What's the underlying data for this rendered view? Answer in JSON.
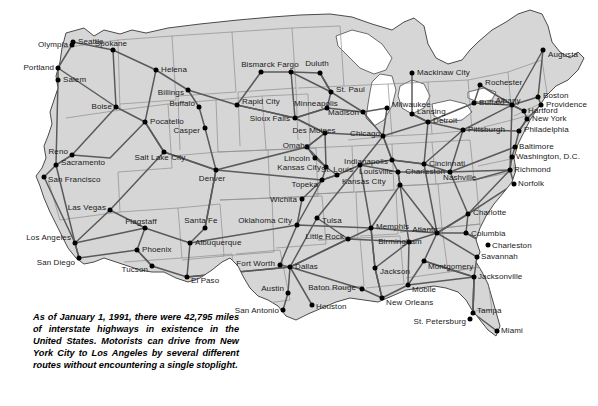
{
  "map": {
    "title": "Interstate Highway Map of the United States",
    "colors": {
      "background": "#ffffff",
      "land": "#d6d6d6",
      "state_border": "#8c8c8c",
      "coastline": "#4a4a4a",
      "highway": "#5a5a5a",
      "city_dot": "#000000",
      "label_text": "#1a1a1a"
    },
    "caption": "As of January 1, 1991, there were 42,795 miles of interstate highways in existence in the United States. Motorists can drive from New York City to Los Angeles by several different routes without encountering a single stoplight.",
    "cities": [
      {
        "name": "Olympia",
        "x": 72,
        "y": 45,
        "lx": 68,
        "ly": 45,
        "align": "l"
      },
      {
        "name": "Seattle",
        "x": 73,
        "y": 42,
        "lx": 78,
        "ly": 42,
        "align": "r"
      },
      {
        "name": "Spokane",
        "x": 113,
        "y": 50,
        "lx": 111,
        "ly": 44,
        "align": "c"
      },
      {
        "name": "Portland",
        "x": 58,
        "y": 68,
        "lx": 54,
        "ly": 68,
        "align": "l"
      },
      {
        "name": "Salem",
        "x": 58,
        "y": 80,
        "lx": 63,
        "ly": 80,
        "align": "r"
      },
      {
        "name": "Helena",
        "x": 156,
        "y": 70,
        "lx": 161,
        "ly": 70,
        "align": "r"
      },
      {
        "name": "Billings",
        "x": 188,
        "y": 90,
        "lx": 184,
        "ly": 93,
        "align": "l"
      },
      {
        "name": "Boise",
        "x": 116,
        "y": 107,
        "lx": 112,
        "ly": 107,
        "align": "l"
      },
      {
        "name": "Buffalo",
        "x": 199,
        "y": 107,
        "lx": 195,
        "ly": 104,
        "align": "l"
      },
      {
        "name": "Pocatello",
        "x": 145,
        "y": 122,
        "lx": 150,
        "ly": 122,
        "align": "r"
      },
      {
        "name": "Casper",
        "x": 205,
        "y": 128,
        "lx": 200,
        "ly": 131,
        "align": "l"
      },
      {
        "name": "Bismarck",
        "x": 261,
        "y": 72,
        "lx": 258,
        "ly": 65,
        "align": "c"
      },
      {
        "name": "Fargo",
        "x": 291,
        "y": 72,
        "lx": 288,
        "ly": 65,
        "align": "c"
      },
      {
        "name": "Duluth",
        "x": 320,
        "y": 73,
        "lx": 317,
        "ly": 64,
        "align": "c"
      },
      {
        "name": "Mackinaw City",
        "x": 412,
        "y": 73,
        "lx": 417,
        "ly": 73,
        "align": "r"
      },
      {
        "name": "Rochester",
        "x": 480,
        "y": 85,
        "lx": 485,
        "ly": 83,
        "align": "r"
      },
      {
        "name": "Augusta",
        "x": 543,
        "y": 50,
        "lx": 548,
        "ly": 55,
        "align": "r"
      },
      {
        "name": "St. Paul",
        "x": 331,
        "y": 92,
        "lx": 336,
        "ly": 90,
        "align": "r"
      },
      {
        "name": "Rapid City",
        "x": 237,
        "y": 105,
        "lx": 242,
        "ly": 102,
        "align": "r"
      },
      {
        "name": "Minneapolis",
        "x": 327,
        "y": 108,
        "lx": 316,
        "ly": 104,
        "align": "c"
      },
      {
        "name": "Madison",
        "x": 363,
        "y": 112,
        "lx": 359,
        "ly": 113,
        "align": "l"
      },
      {
        "name": "Milwaukee",
        "x": 387,
        "y": 108,
        "lx": 392,
        "ly": 105,
        "align": "r"
      },
      {
        "name": "Buffalo",
        "x": 474,
        "y": 103,
        "lx": 479,
        "ly": 103,
        "align": "r"
      },
      {
        "name": "Albany",
        "x": 512,
        "y": 105,
        "lx": 508,
        "ly": 101,
        "align": "c"
      },
      {
        "name": "Boston",
        "x": 538,
        "y": 97,
        "lx": 543,
        "ly": 96,
        "align": "r"
      },
      {
        "name": "Providence",
        "x": 541,
        "y": 105,
        "lx": 546,
        "ly": 105,
        "align": "r"
      },
      {
        "name": "Hartford",
        "x": 524,
        "y": 111,
        "lx": 528,
        "ly": 111,
        "align": "r"
      },
      {
        "name": "New York",
        "x": 527,
        "y": 119,
        "lx": 532,
        "ly": 119,
        "align": "r"
      },
      {
        "name": "Sioux Falls",
        "x": 295,
        "y": 118,
        "lx": 290,
        "ly": 119,
        "align": "l"
      },
      {
        "name": "Detroit",
        "x": 428,
        "y": 122,
        "lx": 433,
        "ly": 121,
        "align": "r"
      },
      {
        "name": "Lansing",
        "x": 412,
        "y": 114,
        "lx": 417,
        "ly": 112,
        "align": "r"
      },
      {
        "name": "Des Moines",
        "x": 325,
        "y": 133,
        "lx": 314,
        "ly": 131,
        "align": "c"
      },
      {
        "name": "Chicago",
        "x": 383,
        "y": 136,
        "lx": 350,
        "ly": 134,
        "align": "r"
      },
      {
        "name": "Pittsburgh",
        "x": 463,
        "y": 130,
        "lx": 468,
        "ly": 130,
        "align": "r"
      },
      {
        "name": "Philadelphia",
        "x": 519,
        "y": 131,
        "lx": 524,
        "ly": 130,
        "align": "r"
      },
      {
        "name": "Reno",
        "x": 72,
        "y": 155,
        "lx": 68,
        "ly": 152,
        "align": "l"
      },
      {
        "name": "Salt Lake City",
        "x": 164,
        "y": 152,
        "lx": 160,
        "ly": 158,
        "align": "c"
      },
      {
        "name": "Omaha",
        "x": 307,
        "y": 147,
        "lx": 296,
        "ly": 146,
        "align": "c"
      },
      {
        "name": "Indianapolis",
        "x": 392,
        "y": 160,
        "lx": 388,
        "ly": 162,
        "align": "l"
      },
      {
        "name": "Cincinnati",
        "x": 424,
        "y": 164,
        "lx": 429,
        "ly": 164,
        "align": "r"
      },
      {
        "name": "Baltimore",
        "x": 515,
        "y": 147,
        "lx": 519,
        "ly": 147,
        "align": "r"
      },
      {
        "name": "Washington, D.C.",
        "x": 512,
        "y": 157,
        "lx": 516,
        "ly": 157,
        "align": "r"
      },
      {
        "name": "Sacramento",
        "x": 56,
        "y": 165,
        "lx": 61,
        "ly": 163,
        "align": "r"
      },
      {
        "name": "San Francisco",
        "x": 44,
        "y": 177,
        "lx": 48,
        "ly": 180,
        "align": "r"
      },
      {
        "name": "Denver",
        "x": 216,
        "y": 170,
        "lx": 212,
        "ly": 179,
        "align": "c"
      },
      {
        "name": "Lincoln",
        "x": 315,
        "y": 158,
        "lx": 310,
        "ly": 159,
        "align": "l"
      },
      {
        "name": "Kansas City",
        "x": 326,
        "y": 167,
        "lx": 321,
        "ly": 168,
        "align": "l"
      },
      {
        "name": "Kansas City",
        "x": 337,
        "y": 175,
        "lx": 342,
        "ly": 182,
        "align": "r"
      },
      {
        "name": "Topeka",
        "x": 322,
        "y": 180,
        "lx": 318,
        "ly": 185,
        "align": "l"
      },
      {
        "name": "St. Louis",
        "x": 360,
        "y": 165,
        "lx": 353,
        "ly": 170,
        "align": "l"
      },
      {
        "name": "Louisville",
        "x": 398,
        "y": 172,
        "lx": 393,
        "ly": 172,
        "align": "l"
      },
      {
        "name": "Nashville",
        "x": 400,
        "y": 185,
        "lx": 443,
        "ly": 178,
        "align": "r"
      },
      {
        "name": "Richmond",
        "x": 510,
        "y": 170,
        "lx": 514,
        "ly": 170,
        "align": "r"
      },
      {
        "name": "Norfolk",
        "x": 514,
        "y": 184,
        "lx": 518,
        "ly": 184,
        "align": "r"
      },
      {
        "name": "Charleston",
        "x": 450,
        "y": 172,
        "lx": 445,
        "ly": 172,
        "align": "l"
      },
      {
        "name": "Las Vegas",
        "x": 110,
        "y": 210,
        "lx": 106,
        "ly": 208,
        "align": "l"
      },
      {
        "name": "Wichita",
        "x": 302,
        "y": 199,
        "lx": 297,
        "ly": 200,
        "align": "l"
      },
      {
        "name": "Flagstaff",
        "x": 145,
        "y": 228,
        "lx": 141,
        "ly": 222,
        "align": "c"
      },
      {
        "name": "Santa Fe",
        "x": 205,
        "y": 228,
        "lx": 201,
        "ly": 221,
        "align": "c"
      },
      {
        "name": "Oklahoma City",
        "x": 297,
        "y": 225,
        "lx": 292,
        "ly": 221,
        "align": "l"
      },
      {
        "name": "Tulsa",
        "x": 317,
        "y": 218,
        "lx": 322,
        "ly": 221,
        "align": "r"
      },
      {
        "name": "Memphis",
        "x": 371,
        "y": 228,
        "lx": 376,
        "ly": 227,
        "align": "r"
      },
      {
        "name": "Atlanta",
        "x": 437,
        "y": 233,
        "lx": 425,
        "ly": 230,
        "align": "c"
      },
      {
        "name": "Charlotte",
        "x": 468,
        "y": 214,
        "lx": 473,
        "ly": 213,
        "align": "r"
      },
      {
        "name": "Los Angeles",
        "x": 75,
        "y": 243,
        "lx": 71,
        "ly": 238,
        "align": "l"
      },
      {
        "name": "Phoenix",
        "x": 137,
        "y": 250,
        "lx": 142,
        "ly": 250,
        "align": "r"
      },
      {
        "name": "Albuquerque",
        "x": 190,
        "y": 243,
        "lx": 195,
        "ly": 243,
        "align": "r"
      },
      {
        "name": "Little Rock",
        "x": 348,
        "y": 239,
        "lx": 344,
        "ly": 237,
        "align": "l"
      },
      {
        "name": "Birmingham",
        "x": 409,
        "y": 242,
        "lx": 400,
        "ly": 242,
        "align": "c"
      },
      {
        "name": "Columbia",
        "x": 466,
        "y": 233,
        "lx": 471,
        "ly": 234,
        "align": "r"
      },
      {
        "name": "Charleston",
        "x": 488,
        "y": 245,
        "lx": 492,
        "ly": 246,
        "align": "r"
      },
      {
        "name": "Savannah",
        "x": 477,
        "y": 257,
        "lx": 481,
        "ly": 257,
        "align": "r"
      },
      {
        "name": "San Diego",
        "x": 79,
        "y": 258,
        "lx": 75,
        "ly": 263,
        "align": "l"
      },
      {
        "name": "Tucson",
        "x": 152,
        "y": 266,
        "lx": 148,
        "ly": 270,
        "align": "l"
      },
      {
        "name": "El Paso",
        "x": 187,
        "y": 277,
        "lx": 191,
        "ly": 281,
        "align": "r"
      },
      {
        "name": "Fort Worth",
        "x": 280,
        "y": 265,
        "lx": 275,
        "ly": 264,
        "align": "l"
      },
      {
        "name": "Dallas",
        "x": 290,
        "y": 267,
        "lx": 295,
        "ly": 267,
        "align": "r"
      },
      {
        "name": "Jackson",
        "x": 375,
        "y": 268,
        "lx": 380,
        "ly": 272,
        "align": "r"
      },
      {
        "name": "Montgomery",
        "x": 424,
        "y": 261,
        "lx": 428,
        "ly": 267,
        "align": "r"
      },
      {
        "name": "Jacksonville",
        "x": 474,
        "y": 277,
        "lx": 478,
        "ly": 277,
        "align": "r"
      },
      {
        "name": "Austin",
        "x": 288,
        "y": 293,
        "lx": 284,
        "ly": 289,
        "align": "l"
      },
      {
        "name": "Baton Rouge",
        "x": 362,
        "y": 289,
        "lx": 356,
        "ly": 288,
        "align": "l"
      },
      {
        "name": "Mobile",
        "x": 408,
        "y": 285,
        "lx": 412,
        "ly": 290,
        "align": "r"
      },
      {
        "name": "New Orleans",
        "x": 382,
        "y": 298,
        "lx": 386,
        "ly": 303,
        "align": "r"
      },
      {
        "name": "San Antonio",
        "x": 283,
        "y": 310,
        "lx": 279,
        "ly": 311,
        "align": "l"
      },
      {
        "name": "Houston",
        "x": 312,
        "y": 305,
        "lx": 316,
        "ly": 307,
        "align": "r"
      },
      {
        "name": "Tampa",
        "x": 473,
        "y": 313,
        "lx": 477,
        "ly": 311,
        "align": "r"
      },
      {
        "name": "St. Petersburg",
        "x": 470,
        "y": 319,
        "lx": 466,
        "ly": 322,
        "align": "l"
      },
      {
        "name": "Miami",
        "x": 497,
        "y": 331,
        "lx": 501,
        "ly": 331,
        "align": "r"
      }
    ]
  }
}
